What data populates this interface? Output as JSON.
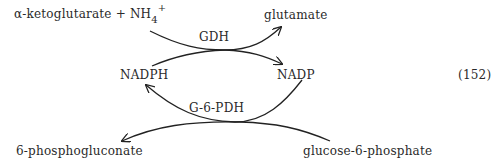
{
  "equation_number": "(152)",
  "reaction_top": {
    "enzyme": "GDH",
    "substrate_main": "α-ketoglutarate + NH",
    "substrate_sub": "4",
    "substrate_sup": "+",
    "product": "glutamate",
    "cofactor_in": "NADPH",
    "cofactor_out": "NADP"
  },
  "reaction_bottom": {
    "enzyme": "G-6-PDH",
    "substrate": "glucose-6-phosphate",
    "product": "6-phosphogluconate"
  }
}
